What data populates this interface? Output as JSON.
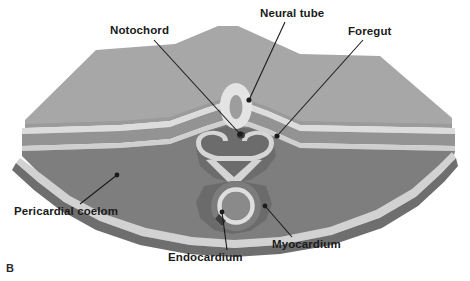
{
  "figure": {
    "panel_letter": "B",
    "type": "embryology cross-section diagram",
    "background_color": "#ffffff"
  },
  "labels": [
    {
      "id": "notochord",
      "text": "Notochord"
    },
    {
      "id": "neural_tube",
      "text": "Neural tube"
    },
    {
      "id": "foregut",
      "text": "Foregut"
    },
    {
      "id": "pericardial",
      "text": "Pericardial coelom"
    },
    {
      "id": "endocardium",
      "text": "Endocardium"
    },
    {
      "id": "myocardium",
      "text": "Myocardium"
    }
  ],
  "colors": {
    "ectoderm_top": "#a7a7a7",
    "ectoderm_top_shade": "#9b9b9b",
    "mesoderm_lower": "#7e7e7e",
    "mesoderm_lower_shade": "#6e6e6e",
    "epithelium_light": "#d9d9d9",
    "epithelium_highlight": "#e8e8e8",
    "cavity_dark": "#6a6a6a",
    "leader_line": "#1b1b1b",
    "text": "#1b1b1b"
  }
}
